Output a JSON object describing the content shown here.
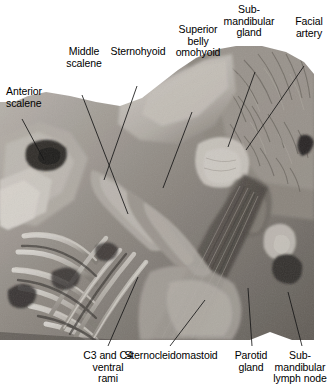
{
  "figure": {
    "kind": "anatomical-dissection-photograph",
    "region": "Anterior triangle of the neck, superficial dissection",
    "width": 332,
    "height": 387,
    "background_color": "#ffffff",
    "leader_line_color": "#161616",
    "label_text_color": "#000000"
  },
  "photo": {
    "x": 0,
    "y": 40,
    "width": 314,
    "height": 300,
    "tone": "grayscale",
    "highlight_color": "#e9e6e1",
    "midtone_color": "#9d9790",
    "shadow_color": "#31302e"
  },
  "labels": {
    "anterior_scalene": "Anterior\nscalene",
    "middle_scalene": "Middle\nscalene",
    "sternohyoid": "Sternohyoid",
    "superior_belly_omohyoid": "Superior\nbelly\nomohyoid",
    "submandibular_gland": "Sub-\nmandibular\ngland",
    "facial_artery": "Facial\nartery",
    "c3_c4_ventral_rami": "C3 and C4\nventral\nrami",
    "sternocleidomastoid": "Sternocleidomastoid",
    "parotid_gland": "Parotid\ngland",
    "submandibular_lymph_node": "Sub-\nmandibular\nlymph node"
  },
  "leader_lines": [
    {
      "name": "anterior-scalene-leader",
      "x1": 22,
      "y1": 119,
      "x2": 44,
      "y2": 160
    },
    {
      "name": "middle-scalene-leader",
      "x1": 82,
      "y1": 95,
      "x2": 128,
      "y2": 214
    },
    {
      "name": "sternohyoid-leader",
      "x1": 137,
      "y1": 86,
      "x2": 104,
      "y2": 180
    },
    {
      "name": "superior-belly-omohyoid-leader",
      "x1": 192,
      "y1": 112,
      "x2": 163,
      "y2": 188
    },
    {
      "name": "submandibular-gland-leader",
      "x1": 255,
      "y1": 72,
      "x2": 228,
      "y2": 147
    },
    {
      "name": "facial-artery-leader",
      "x1": 304,
      "y1": 66,
      "x2": 246,
      "y2": 150
    },
    {
      "name": "c3-c4-ventral-rami-leader",
      "x1": 108,
      "y1": 346,
      "x2": 138,
      "y2": 277
    },
    {
      "name": "sternocleidomastoid-leader",
      "x1": 170,
      "y1": 346,
      "x2": 205,
      "y2": 300
    },
    {
      "name": "parotid-gland-leader",
      "x1": 252,
      "y1": 346,
      "x2": 248,
      "y2": 288
    },
    {
      "name": "submandibular-lymph-node-leader",
      "x1": 302,
      "y1": 346,
      "x2": 288,
      "y2": 292
    }
  ]
}
